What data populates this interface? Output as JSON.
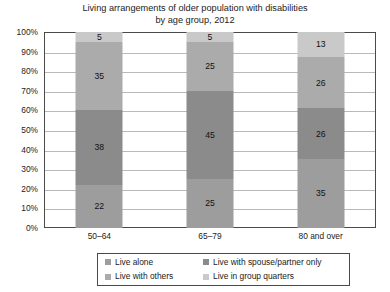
{
  "chart_data": {
    "type": "bar",
    "subtype": "stacked-bar-100-percent",
    "title": "Living arrangements of older population with disabilities by age group, 2012",
    "title_lines": [
      "Living arrangements of older population with disabilities",
      "by age group, 2012"
    ],
    "xlabel": "",
    "ylabel": "",
    "categories": [
      "50–64",
      "65–79",
      "80 and over"
    ],
    "ylim": [
      0,
      100
    ],
    "y_tick_values": [
      0,
      10,
      20,
      30,
      40,
      50,
      60,
      70,
      80,
      90,
      100
    ],
    "y_tick_labels": [
      "0%",
      "10%",
      "20%",
      "30%",
      "40%",
      "50%",
      "60%",
      "70%",
      "80%",
      "90%",
      "100%"
    ],
    "grid": true,
    "legend_position": "bottom",
    "stack_order_bottom_to_top": [
      "Live alone",
      "Live with spouse/partner only",
      "Live with others",
      "Live in group quarters"
    ],
    "series": [
      {
        "name": "Live alone",
        "color": "#9d9d9d",
        "values": [
          22,
          25,
          35
        ]
      },
      {
        "name": "Live with spouse/partner only",
        "color": "#8b8b8b",
        "values": [
          38,
          45,
          26
        ]
      },
      {
        "name": "Live with others",
        "color": "#ababab",
        "values": [
          35,
          25,
          26
        ]
      },
      {
        "name": "Live in group quarters",
        "color": "#c9c9c9",
        "values": [
          5,
          5,
          13
        ]
      }
    ],
    "data_labels": [
      {
        "category": "50–64",
        "labels_bottom_to_top": [
          "22",
          "38",
          "35",
          "5"
        ]
      },
      {
        "category": "65–79",
        "labels_bottom_to_top": [
          "25",
          "45",
          "25",
          "5"
        ]
      },
      {
        "category": "80 and over",
        "labels_bottom_to_top": [
          "35",
          "26",
          "26",
          "13"
        ]
      }
    ]
  },
  "legend": {
    "entries": [
      {
        "label": "Live alone",
        "color": "#9d9d9d"
      },
      {
        "label": "Live with spouse/partner only",
        "color": "#8b8b8b"
      },
      {
        "label": "Live with others",
        "color": "#ababab"
      },
      {
        "label": "Live in group quarters",
        "color": "#c9c9c9"
      }
    ]
  },
  "colors": {
    "plot_border": "#4a4a4a",
    "gridline": "#b9b9b9",
    "background": "#ffffff",
    "text": "#1a1a1a"
  }
}
